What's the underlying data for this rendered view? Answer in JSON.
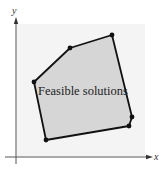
{
  "diagram": {
    "type": "feasible-region",
    "axes": {
      "x_label": "x",
      "y_label": "y"
    },
    "region_label": "Feasible solutions",
    "colors": {
      "background_panel": "#f4f4f4",
      "region_fill": "#d6d6d6",
      "edge": "#111111",
      "axis": "#444444"
    },
    "vertices": [
      {
        "x": 34,
        "y": 82
      },
      {
        "x": 70,
        "y": 48
      },
      {
        "x": 112,
        "y": 35
      },
      {
        "x": 132,
        "y": 117
      },
      {
        "x": 129,
        "y": 126
      },
      {
        "x": 46,
        "y": 140
      }
    ]
  }
}
